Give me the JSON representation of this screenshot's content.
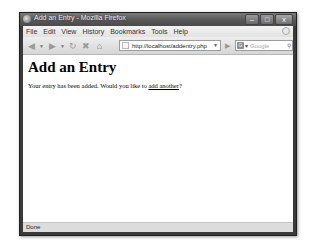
{
  "window": {
    "title": "Add an Entry - Mozilla Firefox",
    "controls": {
      "minimize": "–",
      "maximize": "□",
      "close": "x"
    }
  },
  "menubar": {
    "items": [
      {
        "label": "File"
      },
      {
        "label": "Edit"
      },
      {
        "label": "View"
      },
      {
        "label": "History"
      },
      {
        "label": "Bookmarks"
      },
      {
        "label": "Tools"
      },
      {
        "label": "Help"
      }
    ]
  },
  "navbar": {
    "back": "back-icon",
    "forward": "forward-icon",
    "reload": "reload-icon",
    "stop": "stop-icon",
    "home": "home-icon",
    "url": "http://localhost/addentry.php",
    "search_engine": "G",
    "search_placeholder": "Google"
  },
  "page": {
    "heading": "Add an Entry",
    "message_before": "Your entry has been added. Would you like to ",
    "link_text": "add another",
    "message_after": "?"
  },
  "statusbar": {
    "text": "Done"
  },
  "colors": {
    "frame": "#3a3a3a",
    "chrome": "#d8d8d8",
    "content": "#ffffff"
  }
}
